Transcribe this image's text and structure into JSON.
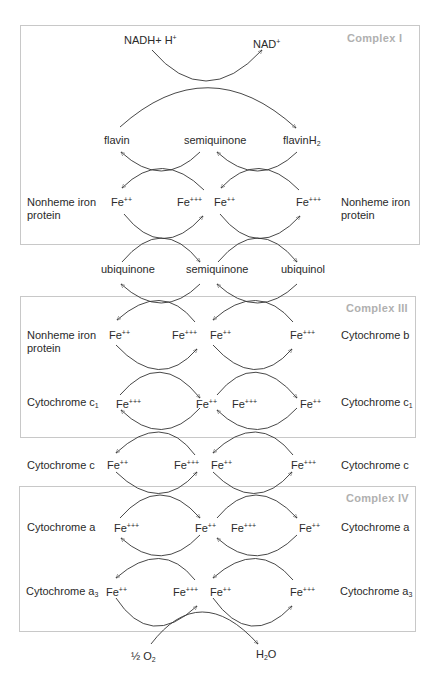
{
  "diagram": {
    "complexes": [
      {
        "label": "Complex I"
      },
      {
        "label": "Complex III"
      },
      {
        "label": "Complex IV"
      }
    ],
    "top": {
      "nadh": {
        "base": "NADH+ H",
        "sup": "+"
      },
      "nad": {
        "base": "NAD",
        "sup": "+"
      }
    },
    "flavin_row": {
      "left": "flavin",
      "mid": "semiquinone",
      "right": {
        "base": "flavinH",
        "sub": "2"
      }
    },
    "ubiquinone_row": {
      "left": "ubiquinone",
      "mid": "semiquinone",
      "right": "ubiquinol"
    },
    "rows": [
      {
        "left_label": "Nonheme iron protein",
        "left_label_line1": "Nonheme iron",
        "left_label_line2": "protein",
        "fe": [
          "++",
          "+++",
          "++",
          "+++"
        ],
        "right_label_line1": "Nonheme iron",
        "right_label_line2": "protein"
      },
      {
        "left_label_line1": "Nonheme iron",
        "left_label_line2": "protein",
        "fe": [
          "++",
          "+++",
          "++",
          "+++"
        ],
        "right_label": "Cytochrome b"
      },
      {
        "left_label": {
          "base": "Cytochrome c",
          "sub": "1"
        },
        "fe": [
          "+++",
          "++",
          "+++",
          "++"
        ],
        "right_label": {
          "base": "Cytochrome c",
          "sub": "1"
        }
      },
      {
        "left_label": "Cytochrome c",
        "fe": [
          "++",
          "+++",
          "++",
          "+++"
        ],
        "right_label": "Cytochrome c"
      },
      {
        "left_label": "Cytochrome a",
        "fe": [
          "+++",
          "++",
          "+++",
          "++"
        ],
        "right_label": "Cytochrome a"
      },
      {
        "left_label": {
          "base": "Cytochrome a",
          "sub": "3"
        },
        "fe": [
          "++",
          "+++",
          "++",
          "+++"
        ],
        "right_label": {
          "base": "Cytochrome a",
          "sub": "3"
        }
      }
    ],
    "fe_base": "Fe",
    "bottom": {
      "o2": {
        "prefix": "½ O",
        "sub": "2"
      },
      "h2o": {
        "pre": "H",
        "sub": "2",
        "post": "O"
      }
    },
    "colors": {
      "box_border": "#c8c8c8",
      "complex_label": "#b0b0b0",
      "text": "#2a2a2a",
      "arrow": "#333333"
    }
  }
}
